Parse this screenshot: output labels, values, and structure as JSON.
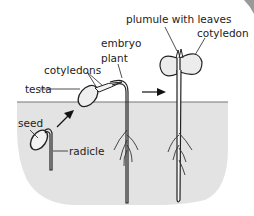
{
  "diagram": {
    "labels": {
      "seed": "seed",
      "radicle": "radicle",
      "testa": "testa",
      "cotyledons": "cotyledons",
      "embryo_plant_line1": "embryo",
      "embryo_plant_line2": "plant",
      "plumule": "plumule with leaves",
      "cotyledon": "cotyledon"
    },
    "colors": {
      "soil": "#e3e3e3",
      "outline": "#222222",
      "fill": "#ececec",
      "background": "#ffffff"
    },
    "stages": [
      "seed with radicle",
      "seedling with cotyledons in testa",
      "young plant with plumule and cotyledons"
    ]
  }
}
